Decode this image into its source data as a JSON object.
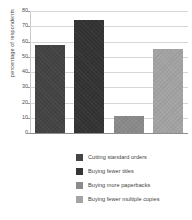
{
  "chart_data": {
    "type": "bar",
    "title": "",
    "subtitle": "",
    "xlabel": "",
    "ylabel": "percentage of respondents",
    "categories": [
      "Cutting standard orders",
      "Buying fewer titles",
      "Buying more paperbacks",
      "Buying fewer multiple copies"
    ],
    "values": [
      58,
      74,
      11,
      55
    ],
    "ylim": [
      0,
      80
    ],
    "yticks": [
      0,
      10,
      20,
      30,
      40,
      50,
      60,
      70,
      80
    ],
    "ytick_labels": [
      "0",
      "10",
      "20",
      "30",
      "40",
      "50",
      "60",
      "70",
      "80"
    ],
    "xtick_labels": [],
    "grid": true,
    "legend_position": "bottom",
    "series": [
      {
        "name": "Cutting standard orders",
        "value": 58,
        "color": "#434343"
      },
      {
        "name": "Buying fewer titles",
        "value": 74,
        "color": "#333333"
      },
      {
        "name": "Buying more paperbacks",
        "value": 11,
        "color": "#8a8a8a"
      },
      {
        "name": "Buying fewer multiple copies",
        "value": 55,
        "color": "#a3a3a3"
      }
    ]
  },
  "axis": {
    "ylabel": "percentage of respondents"
  },
  "legend": {
    "items": [
      {
        "label": "Cutting standard orders",
        "color": "#434343"
      },
      {
        "label": "Buying fewer titles",
        "color": "#333333"
      },
      {
        "label": "Buying more paperbacks",
        "color": "#8a8a8a"
      },
      {
        "label": "Buying fewer multiple copies",
        "color": "#a3a3a3"
      }
    ]
  },
  "style": {
    "background": "#ffffff",
    "gridline_color": "#d6d6d6",
    "axis_color": "#8d8d8d",
    "tick_text_color": "#4f4f4f"
  }
}
